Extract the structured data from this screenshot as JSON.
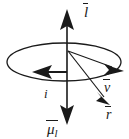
{
  "figure": {
    "type": "physics-vector-diagram",
    "background_color": "#ffffff",
    "stroke_color": "#1a1a1a",
    "labels": {
      "angular_momentum": {
        "base": "l",
        "subscript": "",
        "overbar": true,
        "name": "l-vector-label"
      },
      "magnetic_moment": {
        "base": "μ",
        "subscript": "l",
        "overbar": true,
        "name": "mu-l-vector-label"
      },
      "velocity": {
        "base": "v",
        "subscript": "",
        "overbar": true,
        "name": "v-vector-label"
      },
      "radius": {
        "base": "r",
        "subscript": "",
        "overbar": true,
        "name": "r-vector-label"
      },
      "current": {
        "base": "i",
        "subscript": "",
        "overbar": false,
        "name": "current-label"
      }
    },
    "elements": [
      {
        "name": "orbit-ellipse",
        "shape": "ellipse",
        "cx": 64,
        "cy": 62,
        "rx": 57,
        "ry": 19
      },
      {
        "name": "vertical-axis",
        "shape": "line",
        "x1": 67,
        "y1": 14,
        "x2": 67,
        "y2": 118
      },
      {
        "name": "angular-momentum-arrow",
        "direction": "up",
        "tip_x": 67,
        "tip_y": 12
      },
      {
        "name": "magnetic-moment-arrow",
        "direction": "down",
        "tip_x": 67,
        "tip_y": 120
      },
      {
        "name": "current-arrow",
        "direction": "left",
        "tip_x": 35,
        "tip_y": 73
      },
      {
        "name": "velocity-arrow",
        "direction": "right-down",
        "tip_x": 122,
        "tip_y": 70
      },
      {
        "name": "radius-arrow",
        "direction": "down-right",
        "from_x": 68,
        "from_y": 52,
        "tip_x": 107,
        "tip_y": 101
      }
    ]
  }
}
